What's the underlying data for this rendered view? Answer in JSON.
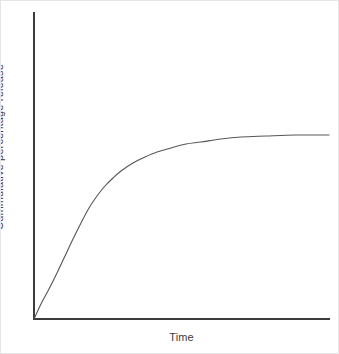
{
  "figure": {
    "background_color": "#ffffff",
    "border_color": "#e6e6e6",
    "width": 339,
    "height": 354
  },
  "axes": {
    "line_color": "#3c3c3c",
    "y_axis": {
      "label": "Cummulative percentage release",
      "x_px": 33,
      "top_px": 12,
      "bottom_px": 318
    },
    "x_axis": {
      "label": "Time",
      "y_px": 318,
      "left_px": 33,
      "right_px": 328
    }
  },
  "chart_data": {
    "type": "line",
    "title": "",
    "subtitle": "",
    "xlabel": "Time",
    "ylabel": "Cummulative percentage release",
    "grid": false,
    "legend": false,
    "legend_position": "none",
    "axis_ticks": {
      "x": [],
      "y": []
    },
    "xlim": [
      0,
      100
    ],
    "ylim": [
      0,
      100
    ],
    "annotations": [],
    "series": [
      {
        "name": "Cummulative percentage release",
        "color": "#565656",
        "style": "solid",
        "description": "First-order / saturating release profile rising steeply from the origin and plateauing at an asymptote near 60 percent of full axis height",
        "x": [
          0,
          2,
          4,
          6,
          8,
          10,
          13,
          16,
          20,
          25,
          30,
          37,
          44,
          52,
          60,
          70,
          80,
          90,
          100
        ],
        "y": [
          0,
          9,
          18,
          25,
          32,
          38,
          46,
          52,
          59,
          65,
          70,
          75,
          78,
          80,
          81,
          82,
          82.5,
          83,
          83
        ]
      }
    ],
    "curve_pixels": [
      [
        33,
        318
      ],
      [
        40,
        303
      ],
      [
        48,
        288
      ],
      [
        56,
        272
      ],
      [
        64,
        255
      ],
      [
        72,
        238
      ],
      [
        80,
        222
      ],
      [
        88,
        207
      ],
      [
        96,
        195
      ],
      [
        104,
        185
      ],
      [
        112,
        177
      ],
      [
        120,
        170
      ],
      [
        132,
        162
      ],
      [
        144,
        156
      ],
      [
        156,
        151
      ],
      [
        170,
        147
      ],
      [
        185,
        143
      ],
      [
        200,
        141
      ],
      [
        220,
        138
      ],
      [
        240,
        136
      ],
      [
        265,
        135
      ],
      [
        295,
        134
      ],
      [
        328,
        134
      ]
    ]
  }
}
